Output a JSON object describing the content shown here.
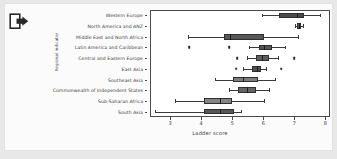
{
  "toolbar": {
    "export_icon": "export-icon"
  },
  "chart_data": {
    "type": "box",
    "title": "",
    "xlabel": "Ladder score",
    "ylabel": "Regional indicator",
    "xlim": [
      2.35,
      8.15
    ],
    "xticks": [
      3,
      4,
      5,
      6,
      7,
      8
    ],
    "xtick_labels": [
      "3",
      "4",
      "5",
      "6",
      "7",
      "8"
    ],
    "grid": false,
    "legend": "none",
    "orientation": "horizontal",
    "categories": [
      "Western Europe",
      "North America and ANZ",
      "Middle East and North Africa",
      "Latin America and Caribbean",
      "Central and Eastern Europe",
      "East Asia",
      "Southeast Asia",
      "Commonwealth of Independent States",
      "Sub-Saharan Africa",
      "South Asia"
    ],
    "boxes": [
      {
        "category": "Western Europe",
        "whisker_low": 5.95,
        "q1": 6.5,
        "median": 7.08,
        "q3": 7.3,
        "whisker_high": 7.84,
        "outliers": [],
        "fill": "#4a4a4a"
      },
      {
        "category": "North America and ANZ",
        "whisker_low": 7.03,
        "q1": 7.09,
        "median": 7.14,
        "q3": 7.22,
        "whisker_high": 7.28,
        "outliers": [],
        "fill": "#5a5a5a"
      },
      {
        "category": "Middle East and North Africa",
        "whisker_low": 3.56,
        "q1": 4.72,
        "median": 4.92,
        "q3": 6.02,
        "whisker_high": 7.13,
        "outliers": [],
        "fill": "#585858"
      },
      {
        "category": "Latin America and Caribbean",
        "whisker_low": 5.53,
        "q1": 5.85,
        "median": 6.02,
        "q3": 6.29,
        "whisker_high": 6.7,
        "outliers": [
          3.62,
          4.91
        ],
        "fill": "#555555"
      },
      {
        "category": "Central and Eastern Europe",
        "whisker_low": 5.47,
        "q1": 5.77,
        "median": 5.97,
        "q3": 6.19,
        "whisker_high": 6.47,
        "outliers": [
          5.16,
          7.0
        ],
        "fill": "#5e5e5e"
      },
      {
        "category": "East Asia",
        "whisker_low": 5.34,
        "q1": 5.65,
        "median": 5.79,
        "q3": 5.93,
        "whisker_high": 6.08,
        "outliers": [
          5.13,
          6.58
        ],
        "fill": "#4f4f4f"
      },
      {
        "category": "Southeast Asia",
        "whisker_low": 4.43,
        "q1": 5.02,
        "median": 5.36,
        "q3": 5.83,
        "whisker_high": 6.38,
        "outliers": [],
        "fill": "#7d7d7d"
      },
      {
        "category": "Commonwealth of Independent States",
        "whisker_low": 4.88,
        "q1": 5.18,
        "median": 5.47,
        "q3": 5.76,
        "whisker_high": 6.17,
        "outliers": [],
        "fill": "#646464"
      },
      {
        "category": "Sub-Saharan Africa",
        "whisker_low": 3.15,
        "q1": 4.09,
        "median": 4.6,
        "q3": 5.0,
        "whisker_high": 6.02,
        "outliers": [],
        "fill": "#858585"
      },
      {
        "category": "South Asia",
        "whisker_low": 2.52,
        "q1": 4.09,
        "median": 4.62,
        "q3": 5.05,
        "whisker_high": 5.27,
        "outliers": [],
        "fill": "#565656"
      }
    ]
  },
  "colors": {
    "axis": "#4a4a4a",
    "text": "#3b3b3b",
    "plot_bg": "#ffffff",
    "page_bg": "#fbfbfb",
    "canvas_bg": "#e8e8e8"
  }
}
